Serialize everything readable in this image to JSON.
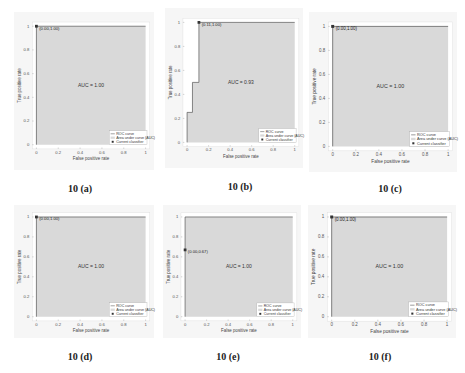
{
  "chart_data": [
    {
      "id": "a",
      "type": "area",
      "caption": "10 (a)",
      "xlabel": "False positive rate",
      "ylabel": "True positive rate",
      "xticks": [
        "0",
        "0.2",
        "0.4",
        "0.6",
        "0.8",
        "1"
      ],
      "yticks": [
        "0",
        "0.2",
        "0.4",
        "0.6",
        "0.8",
        "1"
      ],
      "xlim": [
        0,
        1
      ],
      "ylim": [
        0,
        1
      ],
      "auc_label": "AUC = 1.00",
      "auc": 1.0,
      "roc_x": [
        0,
        0,
        1
      ],
      "roc_y": [
        0,
        1,
        1
      ],
      "point": {
        "x": 0.0,
        "y": 1.0,
        "label": "(0.00,1.00)"
      },
      "legend": [
        "ROC curve",
        "Area under curve (AUC)",
        "Current classifier"
      ]
    },
    {
      "id": "b",
      "type": "area",
      "caption": "10 (b)",
      "xlabel": "False positive rate",
      "ylabel": "True positive rate",
      "xticks": [
        "0",
        "0.2",
        "0.4",
        "0.6",
        "0.8",
        "1"
      ],
      "yticks": [
        "0",
        "0.2",
        "0.4",
        "0.6",
        "0.8",
        "1"
      ],
      "xlim": [
        0,
        1
      ],
      "ylim": [
        0,
        1
      ],
      "auc_label": "AUC = 0.93",
      "auc": 0.93,
      "roc_x": [
        0,
        0,
        0.05,
        0.05,
        0.11,
        0.11,
        1
      ],
      "roc_y": [
        0,
        0.25,
        0.25,
        0.5,
        0.5,
        1,
        1
      ],
      "point": {
        "x": 0.11,
        "y": 1.0,
        "label": "(0.11,1.00)"
      },
      "legend": [
        "ROC curve",
        "Area under curve (AUC)",
        "Current classifier"
      ]
    },
    {
      "id": "c",
      "type": "area",
      "caption": "10 (c)",
      "xlabel": "False positive rate",
      "ylabel": "True positive rate",
      "xticks": [
        "0",
        "0.2",
        "0.4",
        "0.6",
        "0.8",
        "1"
      ],
      "yticks": [
        "0",
        "0.2",
        "0.4",
        "0.6",
        "0.8",
        "1"
      ],
      "xlim": [
        0,
        1
      ],
      "ylim": [
        0,
        1
      ],
      "auc_label": "AUC = 1.00",
      "auc": 1.0,
      "roc_x": [
        0,
        0,
        1
      ],
      "roc_y": [
        0,
        1,
        1
      ],
      "point": {
        "x": 0.0,
        "y": 1.0,
        "label": "(0.00,1.00)"
      },
      "legend": [
        "ROC curve",
        "Area under curve (AUC)",
        "Current classifier"
      ]
    },
    {
      "id": "d",
      "type": "area",
      "caption": "10 (d)",
      "xlabel": "False positive rate",
      "ylabel": "True positive rate",
      "xticks": [
        "0",
        "0.2",
        "0.4",
        "0.6",
        "0.8",
        "1"
      ],
      "yticks": [
        "0",
        "0.2",
        "0.4",
        "0.6",
        "0.8",
        "1"
      ],
      "xlim": [
        0,
        1
      ],
      "ylim": [
        0,
        1
      ],
      "auc_label": "AUC = 1.00",
      "auc": 1.0,
      "roc_x": [
        0,
        0,
        1
      ],
      "roc_y": [
        0,
        1,
        1
      ],
      "point": {
        "x": 0.0,
        "y": 1.0,
        "label": "(0.00,1.00)"
      },
      "legend": [
        "ROC curve",
        "Area under curve (AUC)",
        "Current classifier"
      ]
    },
    {
      "id": "e",
      "type": "area",
      "caption": "10 (e)",
      "xlabel": "False positive rate",
      "ylabel": "True positive rate",
      "xticks": [
        "0",
        "0.2",
        "0.4",
        "0.6",
        "0.8",
        "1"
      ],
      "yticks": [
        "0",
        "0.2",
        "0.4",
        "0.6",
        "0.8",
        "1"
      ],
      "xlim": [
        0,
        1
      ],
      "ylim": [
        0,
        1
      ],
      "auc_label": "AUC = 1.00",
      "auc": 1.0,
      "roc_x": [
        0,
        0,
        1
      ],
      "roc_y": [
        0,
        1,
        1
      ],
      "point": {
        "x": 0.0,
        "y": 0.67,
        "label": "(0.00,0.67)"
      },
      "legend": [
        "ROC curve",
        "Area under curve (AUC)",
        "Current classifier"
      ]
    },
    {
      "id": "f",
      "type": "area",
      "caption": "10 (f)",
      "xlabel": "False positive rate",
      "ylabel": "True positive rate",
      "xticks": [
        "0",
        "0.2",
        "0.4",
        "0.6",
        "0.8",
        "1"
      ],
      "yticks": [
        "0",
        "0.2",
        "0.4",
        "0.6",
        "0.8",
        "1"
      ],
      "xlim": [
        0,
        1
      ],
      "ylim": [
        0,
        1
      ],
      "auc_label": "AUC = 1.00",
      "auc": 1.0,
      "roc_x": [
        0,
        0,
        1
      ],
      "roc_y": [
        0,
        1,
        1
      ],
      "point": {
        "x": 0.0,
        "y": 1.0,
        "label": "(0.00,1.00)"
      },
      "legend": [
        "ROC curve",
        "Area under curve (AUC)",
        "Current classifier"
      ]
    }
  ],
  "layout": [
    {
      "panel": [
        14,
        12,
        140,
        158
      ],
      "caption": [
        30,
        183
      ]
    },
    {
      "panel": [
        165,
        8,
        138,
        160
      ],
      "caption": [
        190,
        181
      ]
    },
    {
      "panel": [
        309,
        12,
        148,
        160
      ],
      "caption": [
        340,
        183
      ]
    },
    {
      "panel": [
        14,
        205,
        140,
        133
      ],
      "caption": [
        30,
        351
      ]
    },
    {
      "panel": [
        163,
        205,
        138,
        133
      ],
      "caption": [
        178,
        351
      ]
    },
    {
      "panel": [
        308,
        205,
        148,
        133
      ],
      "caption": [
        330,
        351
      ]
    }
  ],
  "colors": {
    "area": "#d9d9d9",
    "curve": "#555555",
    "axis": "#999999",
    "point": "#333333",
    "panel_bg": "#f6f6f6"
  }
}
